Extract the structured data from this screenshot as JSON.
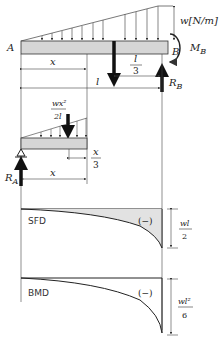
{
  "diagram": {
    "beam": {
      "left_label": "A",
      "right_label": "B",
      "load_label": "w[N/m]",
      "moment_label": "M",
      "moment_sub": "B",
      "reaction_b_label": "R",
      "reaction_b_sub": "B",
      "dim_x_label": "x",
      "dim_l_label": "l",
      "dim_l3_num": "l",
      "dim_l3_den": "3"
    },
    "section": {
      "resultant_num": "wx²",
      "resultant_den": "2l",
      "dim_x3_num": "x",
      "dim_x3_den": "3",
      "dim_x_label": "x",
      "reaction_a_label": "R",
      "reaction_a_sub": "A"
    },
    "sfd": {
      "title": "SFD",
      "sign": "(−)",
      "max_num": "wl",
      "max_den": "2"
    },
    "bmd": {
      "title": "BMD",
      "sign": "(−)",
      "max_num": "wl²",
      "max_den": "6"
    },
    "colors": {
      "beam_fill": "#d6d6d6",
      "stroke": "#222222",
      "sfd_fill": "#e2e2e2"
    }
  }
}
